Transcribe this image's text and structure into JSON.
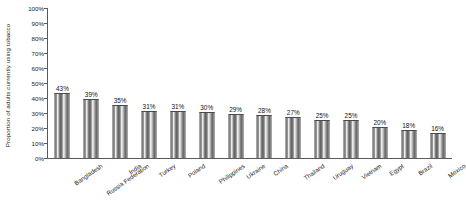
{
  "chart_data": {
    "type": "bar",
    "title": "",
    "xlabel": "",
    "ylabel": "Proportion of adults currently using tobacco",
    "ylim": [
      0,
      100
    ],
    "y_tick_labels": [
      "0%",
      "10%",
      "20%",
      "30%",
      "40%",
      "50%",
      "60%",
      "70%",
      "80%",
      "90%",
      "100%"
    ],
    "y_tick_values": [
      0,
      10,
      20,
      30,
      40,
      50,
      60,
      70,
      80,
      90,
      100
    ],
    "grid": false,
    "legend": null,
    "categories": [
      "Bangladesh",
      "Russia Federation",
      "India",
      "Turkey",
      "Poland",
      "Philippines",
      "Ukraine",
      "China",
      "Thailand",
      "Uruguay",
      "Vietnam",
      "Egypt",
      "Brazil",
      "Mexico"
    ],
    "values": [
      43,
      39,
      35,
      31,
      31,
      30,
      29,
      28,
      27,
      25,
      25,
      20,
      18,
      16
    ],
    "data_labels": [
      "43%",
      "39%",
      "35%",
      "31%",
      "31%",
      "30%",
      "29%",
      "28%",
      "27%",
      "25%",
      "25%",
      "20%",
      "18%",
      "16%"
    ],
    "colors": {
      "bar_fill_dark": "#5d5d5d",
      "bar_fill_light": "#f2f2f2",
      "bar_outline": "#4a4a4a",
      "axis": "#5a5a5a",
      "text": "#1a1a1a"
    }
  }
}
